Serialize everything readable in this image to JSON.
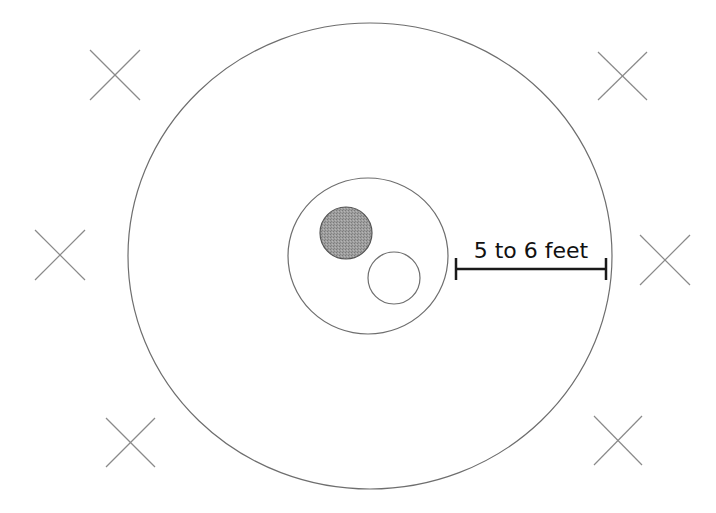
{
  "diagram": {
    "title": "",
    "dimension_label": "5 to 6 feet",
    "colors": {
      "stroke": "#6e6e6e",
      "marker_stroke": "#8a8a8a",
      "filled_circle": "#9a9a9a",
      "dimension_line": "#1a1a1a",
      "background": "#ffffff"
    },
    "outer_circle": {
      "cx": 370,
      "cy": 256,
      "rx": 242,
      "ry": 233
    },
    "inner_circle": {
      "cx": 368,
      "cy": 256,
      "rx": 80,
      "ry": 78
    },
    "filled_circle": {
      "cx": 346,
      "cy": 233,
      "r": 26
    },
    "open_circle": {
      "cx": 394,
      "cy": 278,
      "r": 26
    },
    "dimension": {
      "x1": 456,
      "x2": 606,
      "y": 269
    },
    "markers": [
      {
        "name": "top-left",
        "x1": 90,
        "y1": 50,
        "x2": 140,
        "y2": 100
      },
      {
        "name": "top-right",
        "x1": 598,
        "y1": 52,
        "x2": 647,
        "y2": 100
      },
      {
        "name": "middle-left",
        "x1": 35,
        "y1": 230,
        "x2": 85,
        "y2": 280
      },
      {
        "name": "middle-right",
        "x1": 640,
        "y1": 235,
        "x2": 690,
        "y2": 285
      },
      {
        "name": "bottom-left",
        "x1": 106,
        "y1": 418,
        "x2": 155,
        "y2": 467
      },
      {
        "name": "bottom-right",
        "x1": 594,
        "y1": 416,
        "x2": 642,
        "y2": 465
      }
    ]
  }
}
